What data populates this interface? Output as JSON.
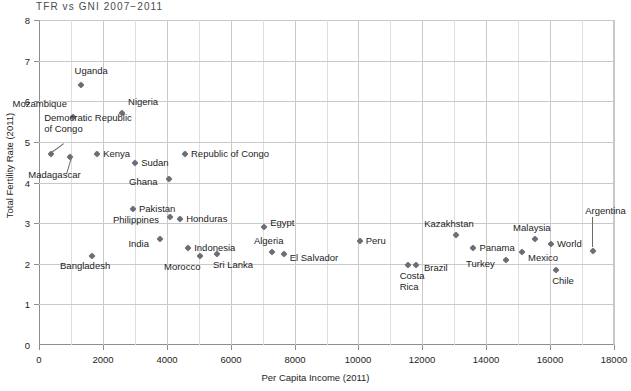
{
  "chart_data": {
    "type": "scatter",
    "title": "TFR vs GNI 2007−2011",
    "xlabel": "Per Capita Income (2011)",
    "ylabel": "Total Fertility Rate (2011)",
    "xlim": [
      0,
      18000
    ],
    "ylim": [
      0,
      8
    ],
    "xticks": [
      0,
      2000,
      4000,
      6000,
      8000,
      10000,
      12000,
      14000,
      16000,
      18000
    ],
    "xtick_labels": [
      "0",
      "2000",
      "4000",
      "6000",
      "8000",
      "10000",
      "12000",
      "14000",
      "16000",
      "18000"
    ],
    "yticks": [
      0,
      1,
      2,
      3,
      4,
      5,
      6,
      7,
      8
    ],
    "ytick_labels": [
      "0",
      "1",
      "2",
      "3",
      "4",
      "5",
      "6",
      "7",
      "8"
    ],
    "minor_x_step": 1000,
    "grid": "both",
    "legend": "none",
    "marker": "diamond",
    "marker_color": "#6d6d78",
    "points": [
      {
        "name": "Uganda",
        "x": 1300,
        "y": 6.4,
        "label_dx": -6,
        "label_dy": -14,
        "label_align": "left"
      },
      {
        "name": "Mozambique",
        "x": 1050,
        "y": 5.62,
        "label_dx": -60,
        "label_dy": -13,
        "label_align": "left"
      },
      {
        "name": "Nigeria",
        "x": 2600,
        "y": 5.72,
        "label_dx": 6,
        "label_dy": -11,
        "label_align": "left"
      },
      {
        "name": "Democratic Republic\nof Congo",
        "x": 380,
        "y": 4.7,
        "label_dx": -7,
        "label_dy": -36,
        "label_align": "left"
      },
      {
        "name": "Madagascar",
        "x": 980,
        "y": 4.62,
        "label_dx": -42,
        "label_dy": 18,
        "label_align": "left"
      },
      {
        "name": "Kenya",
        "x": 1820,
        "y": 4.7,
        "label_dx": 6,
        "label_dy": 0,
        "label_align": "left"
      },
      {
        "name": "Sudan",
        "x": 3010,
        "y": 4.49,
        "label_dx": 6,
        "label_dy": 0,
        "label_align": "left"
      },
      {
        "name": "Republic of Congo",
        "x": 4570,
        "y": 4.7,
        "label_dx": 6,
        "label_dy": 0,
        "label_align": "left"
      },
      {
        "name": "Ghana",
        "x": 4070,
        "y": 4.08,
        "label_dx": -40,
        "label_dy": 3,
        "label_align": "left"
      },
      {
        "name": "Pakistan",
        "x": 2940,
        "y": 3.36,
        "label_dx": 6,
        "label_dy": 0,
        "label_align": "left"
      },
      {
        "name": "Philippines",
        "x": 4100,
        "y": 3.14,
        "label_dx": -57,
        "label_dy": 3,
        "label_align": "left"
      },
      {
        "name": "Honduras",
        "x": 4420,
        "y": 3.1,
        "label_dx": 6,
        "label_dy": 0,
        "label_align": "left"
      },
      {
        "name": "Indonesia",
        "x": 4670,
        "y": 2.4,
        "label_dx": 6,
        "label_dy": 0,
        "label_align": "left"
      },
      {
        "name": "India",
        "x": 3800,
        "y": 2.6,
        "label_dx": -32,
        "label_dy": 5,
        "label_align": "left"
      },
      {
        "name": "Bangladesh",
        "x": 1660,
        "y": 2.2,
        "label_dx": -32,
        "label_dy": 10,
        "label_align": "left"
      },
      {
        "name": "Morocco",
        "x": 5040,
        "y": 2.19,
        "label_dx": -36,
        "label_dy": 11,
        "label_align": "left"
      },
      {
        "name": "Sri Lanka",
        "x": 5570,
        "y": 2.23,
        "label_dx": -4,
        "label_dy": 11,
        "label_align": "left"
      },
      {
        "name": "Algeria",
        "x": 7290,
        "y": 2.3,
        "label_dx": -18,
        "label_dy": -11,
        "label_align": "left"
      },
      {
        "name": "El Salvador",
        "x": 7660,
        "y": 2.25,
        "label_dx": 6,
        "label_dy": 4,
        "label_align": "left"
      },
      {
        "name": "Egypt",
        "x": 7050,
        "y": 2.9,
        "label_dx": 6,
        "label_dy": -4,
        "label_align": "left"
      },
      {
        "name": "Peru",
        "x": 10040,
        "y": 2.55,
        "label_dx": 6,
        "label_dy": 0,
        "label_align": "left"
      },
      {
        "name": "Costa\nRica",
        "x": 11540,
        "y": 1.96,
        "label_dx": -8,
        "label_dy": 11,
        "label_align": "left"
      },
      {
        "name": "Brazil",
        "x": 11800,
        "y": 1.96,
        "label_dx": 8,
        "label_dy": 3,
        "label_align": "left"
      },
      {
        "name": "Kazakhstan",
        "x": 13060,
        "y": 2.7,
        "label_dx": -32,
        "label_dy": -11,
        "label_align": "left"
      },
      {
        "name": "Panama",
        "x": 13600,
        "y": 2.4,
        "label_dx": 6,
        "label_dy": 0,
        "label_align": "left"
      },
      {
        "name": "Turkey",
        "x": 14620,
        "y": 2.1,
        "label_dx": -40,
        "label_dy": 4,
        "label_align": "left"
      },
      {
        "name": "Mexico",
        "x": 15120,
        "y": 2.3,
        "label_dx": 6,
        "label_dy": 6,
        "label_align": "left"
      },
      {
        "name": "Malaysia",
        "x": 15530,
        "y": 2.6,
        "label_dx": -22,
        "label_dy": -11,
        "label_align": "left"
      },
      {
        "name": "World",
        "x": 16030,
        "y": 2.48,
        "label_dx": 6,
        "label_dy": 0,
        "label_align": "left"
      },
      {
        "name": "Chile",
        "x": 16190,
        "y": 1.85,
        "label_dx": -4,
        "label_dy": 11,
        "label_align": "left"
      },
      {
        "name": "Argentina",
        "x": 17350,
        "y": 2.32,
        "label_dx": -8,
        "label_dy": -40,
        "label_align": "left"
      }
    ],
    "leaders": [
      {
        "from_name": "Democratic Republic of Congo",
        "x1": 780,
        "y1": 4.94,
        "x2": 400,
        "y2": 4.72
      },
      {
        "from_name": "Madagascar",
        "x1": 830,
        "y1": 4.22,
        "x2": 985,
        "y2": 4.62
      },
      {
        "from_name": "Argentina",
        "x1": 17350,
        "y1": 3.15,
        "x2": 17350,
        "y2": 2.42
      }
    ]
  }
}
